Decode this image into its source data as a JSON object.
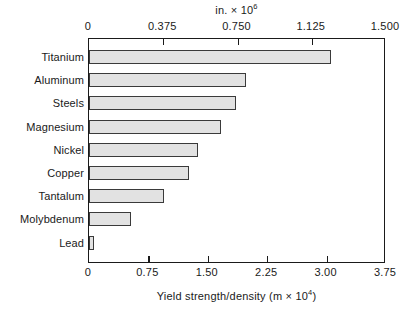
{
  "chart_data": {
    "type": "bar",
    "orientation": "horizontal",
    "title": "",
    "categories": [
      "Titanium",
      "Aluminum",
      "Steels",
      "Magnesium",
      "Nickel",
      "Copper",
      "Tantalum",
      "Molybdenum",
      "Lead"
    ],
    "values": [
      3.06,
      1.98,
      1.86,
      1.67,
      1.38,
      1.26,
      0.95,
      0.53,
      0.06
    ],
    "xlabel": "Yield strength/density (m × 10⁴)",
    "ylabel": "",
    "xlim": [
      0,
      3.75
    ],
    "xticks": [
      0,
      0.75,
      1.5,
      2.25,
      3.0,
      3.75
    ],
    "xticklabels": [
      "0",
      "0.75",
      "1.50",
      "2.25",
      "3.00",
      "3.75"
    ],
    "secondary_axis": {
      "position": "top",
      "label": "in. × 10⁶",
      "lim": [
        0,
        1.5
      ],
      "ticks": [
        0,
        0.375,
        0.75,
        1.125,
        1.5
      ],
      "ticklabels": [
        "0",
        "0.375",
        "0.750",
        "1.125",
        "1.500"
      ]
    },
    "grid": false,
    "legend": null,
    "bar_fill_color": "#e2e2e2",
    "bar_edge_color": "#3a3a3a",
    "axis_color": "#1a1a1a",
    "background_color": "#ffffff"
  },
  "axes": {
    "top": {
      "title_main": "in. × 10",
      "title_exponent": "6",
      "ticklabels": [
        "0",
        "0.375",
        "0.750",
        "1.125",
        "1.500"
      ],
      "tickvalues": [
        0,
        0.375,
        0.75,
        1.125,
        1.5
      ],
      "max": 1.5
    },
    "bottom": {
      "title_main": "Yield strength/density (m × 10",
      "title_exponent": "4",
      "title_tail": ")",
      "ticklabels": [
        "0",
        "0.75",
        "1.50",
        "2.25",
        "3.00",
        "3.75"
      ],
      "tickvalues": [
        0,
        0.75,
        1.5,
        2.25,
        3.0,
        3.75
      ],
      "max": 3.75
    }
  },
  "bars": [
    {
      "label": "Titanium",
      "value": 3.06
    },
    {
      "label": "Aluminum",
      "value": 1.98
    },
    {
      "label": "Steels",
      "value": 1.86
    },
    {
      "label": "Magnesium",
      "value": 1.67
    },
    {
      "label": "Nickel",
      "value": 1.38
    },
    {
      "label": "Copper",
      "value": 1.26
    },
    {
      "label": "Tantalum",
      "value": 0.95
    },
    {
      "label": "Molybdenum",
      "value": 0.53
    },
    {
      "label": "Lead",
      "value": 0.06
    }
  ]
}
